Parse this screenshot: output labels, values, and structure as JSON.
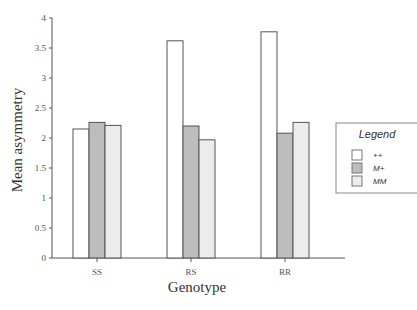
{
  "chart_data": {
    "type": "bar",
    "title": "",
    "xlabel": "Genotype",
    "ylabel": "Mean asymmetry",
    "ylim": [
      0,
      4
    ],
    "yticks": [
      "0",
      "0.5",
      "1",
      "1.5",
      "2",
      "2.5",
      "3",
      "3.5",
      "4"
    ],
    "ytick_values": [
      0,
      0.5,
      1,
      1.5,
      2,
      2.5,
      3,
      3.5,
      4
    ],
    "categories": [
      "SS",
      "RS",
      "RR"
    ],
    "series": [
      {
        "name": "++",
        "values": [
          2.15,
          3.62,
          3.77
        ],
        "color": "#ffffff"
      },
      {
        "name": "M+",
        "values": [
          2.26,
          2.2,
          2.08
        ],
        "color": "#bdbdbd"
      },
      {
        "name": "MM",
        "values": [
          2.21,
          1.97,
          2.26
        ],
        "color": "#ececec"
      }
    ],
    "legend": {
      "title": "Legend",
      "position": "right"
    },
    "grid": false
  }
}
